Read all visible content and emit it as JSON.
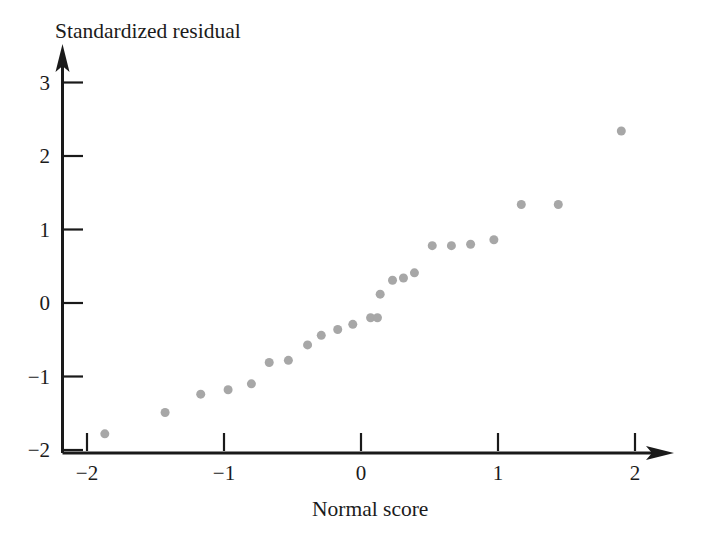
{
  "chart_data": {
    "type": "scatter",
    "title": "",
    "xlabel": "Normal score",
    "ylabel": "Standardized residual",
    "xlim": [
      -2.15,
      2.2
    ],
    "ylim": [
      -2.0,
      3.35
    ],
    "xticks": [
      -2,
      -1,
      0,
      1,
      2
    ],
    "xticklabels": [
      "−2",
      "−1",
      "0",
      "1",
      "2"
    ],
    "yticks": [
      -2,
      -1,
      0,
      1,
      2,
      3
    ],
    "yticklabels": [
      "−2",
      "−1",
      "0",
      "1",
      "2",
      "3"
    ],
    "grid": false,
    "legend": null,
    "marker": "circle",
    "marker_color": "#a7a7a7",
    "marker_size_px": 9,
    "axis_color": "#1a1a1a",
    "background_color": "#ffffff",
    "points": [
      {
        "x": -1.87,
        "y": -1.78
      },
      {
        "x": -1.43,
        "y": -1.49
      },
      {
        "x": -1.17,
        "y": -1.24
      },
      {
        "x": -0.97,
        "y": -1.18
      },
      {
        "x": -0.8,
        "y": -1.1
      },
      {
        "x": -0.67,
        "y": -0.81
      },
      {
        "x": -0.53,
        "y": -0.78
      },
      {
        "x": -0.39,
        "y": -0.57
      },
      {
        "x": -0.29,
        "y": -0.44
      },
      {
        "x": -0.17,
        "y": -0.36
      },
      {
        "x": -0.06,
        "y": -0.29
      },
      {
        "x": 0.07,
        "y": -0.2
      },
      {
        "x": 0.12,
        "y": -0.2
      },
      {
        "x": 0.14,
        "y": 0.12
      },
      {
        "x": 0.23,
        "y": 0.31
      },
      {
        "x": 0.31,
        "y": 0.34
      },
      {
        "x": 0.39,
        "y": 0.41
      },
      {
        "x": 0.52,
        "y": 0.78
      },
      {
        "x": 0.66,
        "y": 0.78
      },
      {
        "x": 0.8,
        "y": 0.8
      },
      {
        "x": 0.97,
        "y": 0.86
      },
      {
        "x": 1.17,
        "y": 1.34
      },
      {
        "x": 1.44,
        "y": 1.34
      },
      {
        "x": 1.9,
        "y": 2.34
      }
    ]
  },
  "axes": {
    "x_title": "Normal score",
    "y_title": "Standardized residual"
  }
}
